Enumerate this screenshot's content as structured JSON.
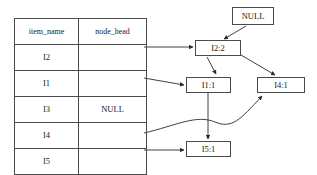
{
  "diagram": {
    "table": {
      "columns": [
        "item_name",
        "node_head"
      ],
      "rows": [
        {
          "item_name": "I2",
          "node_head": ""
        },
        {
          "item_name": "I1",
          "node_head": ""
        },
        {
          "item_name": "I3",
          "node_head": "NULL"
        },
        {
          "item_name": "I4",
          "node_head": ""
        },
        {
          "item_name": "I5",
          "node_head": ""
        }
      ]
    },
    "nodes": [
      {
        "id": "null-node",
        "label": "NULL"
      },
      {
        "id": "i2-node",
        "label": "I2:2"
      },
      {
        "id": "i1-node",
        "label": "I1:1"
      },
      {
        "id": "i4-node",
        "label": "I4:1"
      },
      {
        "id": "i5-node",
        "label": "I5:1"
      }
    ],
    "colors": {
      "stroke": "#4a4a4a",
      "text": "#1a1a1a",
      "background": "#ffffff"
    }
  }
}
